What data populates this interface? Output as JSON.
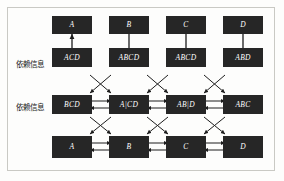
{
  "figure": {
    "background_color": "#fdfdfc",
    "frame_color": "#c9c9c4",
    "node_fill": "#262626",
    "node_text_color": "#ffffff",
    "edge_color": "#1d1d1d"
  },
  "row_labels": [
    {
      "id": "label-row2",
      "text": "依赖信息"
    },
    {
      "id": "label-row3",
      "text": "依赖信息"
    }
  ],
  "rows": [
    {
      "id": "row-top",
      "nodes": [
        {
          "label": "A"
        },
        {
          "label": "B"
        },
        {
          "label": "C"
        },
        {
          "label": "D"
        }
      ]
    },
    {
      "id": "row-second",
      "nodes": [
        {
          "label": "ACD"
        },
        {
          "label": "ABCD"
        },
        {
          "label": "ABCD"
        },
        {
          "label": "ABD"
        }
      ]
    },
    {
      "id": "row-third",
      "nodes": [
        {
          "label": "BCD"
        },
        {
          "label": "A|CD"
        },
        {
          "label": "AB|D"
        },
        {
          "label": "ABC"
        }
      ]
    },
    {
      "id": "row-bottom",
      "nodes": [
        {
          "label": "A"
        },
        {
          "label": "B"
        },
        {
          "label": "C"
        },
        {
          "label": "D"
        }
      ]
    }
  ]
}
